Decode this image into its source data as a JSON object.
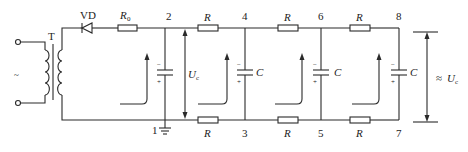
{
  "diagram": {
    "type": "voltage doubler / RC filter circuit schematic",
    "source_symbol": "~",
    "transformer_label": "T",
    "diode_label": "VD",
    "series_resistor": {
      "label": "R",
      "subscript": "0"
    },
    "ladder_resistor_label": "R",
    "capacitor_label": "C",
    "capacitor_polarity": {
      "top": "−",
      "bottom": "+"
    },
    "input_voltage": {
      "label": "U",
      "subscript": "c"
    },
    "output_voltage": {
      "prefix": "≈",
      "label": "U",
      "subscript": "c"
    },
    "nodes": [
      "1",
      "2",
      "3",
      "4",
      "5",
      "6",
      "7",
      "8"
    ]
  }
}
